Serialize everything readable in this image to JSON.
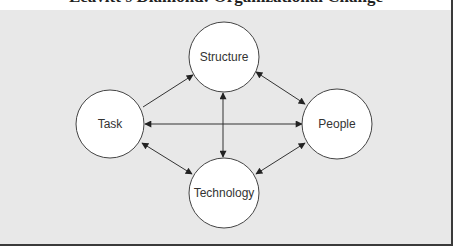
{
  "title": "Leavitt's Diamond: Organizational Change",
  "diagram": {
    "nodes": [
      {
        "id": "structure",
        "label": "Structure",
        "cx": 224,
        "cy": 57,
        "r": 35
      },
      {
        "id": "task",
        "label": "Task",
        "cx": 110,
        "cy": 124,
        "r": 34
      },
      {
        "id": "people",
        "label": "People",
        "cx": 337,
        "cy": 124,
        "r": 35
      },
      {
        "id": "technology",
        "label": "Technology",
        "cx": 224,
        "cy": 193,
        "r": 35
      }
    ],
    "edges": [
      {
        "from": "task",
        "to": "structure",
        "direction": "one-way"
      },
      {
        "from": "structure",
        "to": "people",
        "direction": "two-way"
      },
      {
        "from": "task",
        "to": "technology",
        "direction": "two-way"
      },
      {
        "from": "technology",
        "to": "people",
        "direction": "two-way"
      },
      {
        "from": "task",
        "to": "people",
        "direction": "two-way"
      },
      {
        "from": "structure",
        "to": "technology",
        "direction": "two-way"
      }
    ]
  },
  "colors": {
    "panel_bg": "#e8e8e8",
    "border": "#3a3a3a",
    "node_fill": "#ffffff",
    "stroke": "#333333"
  }
}
